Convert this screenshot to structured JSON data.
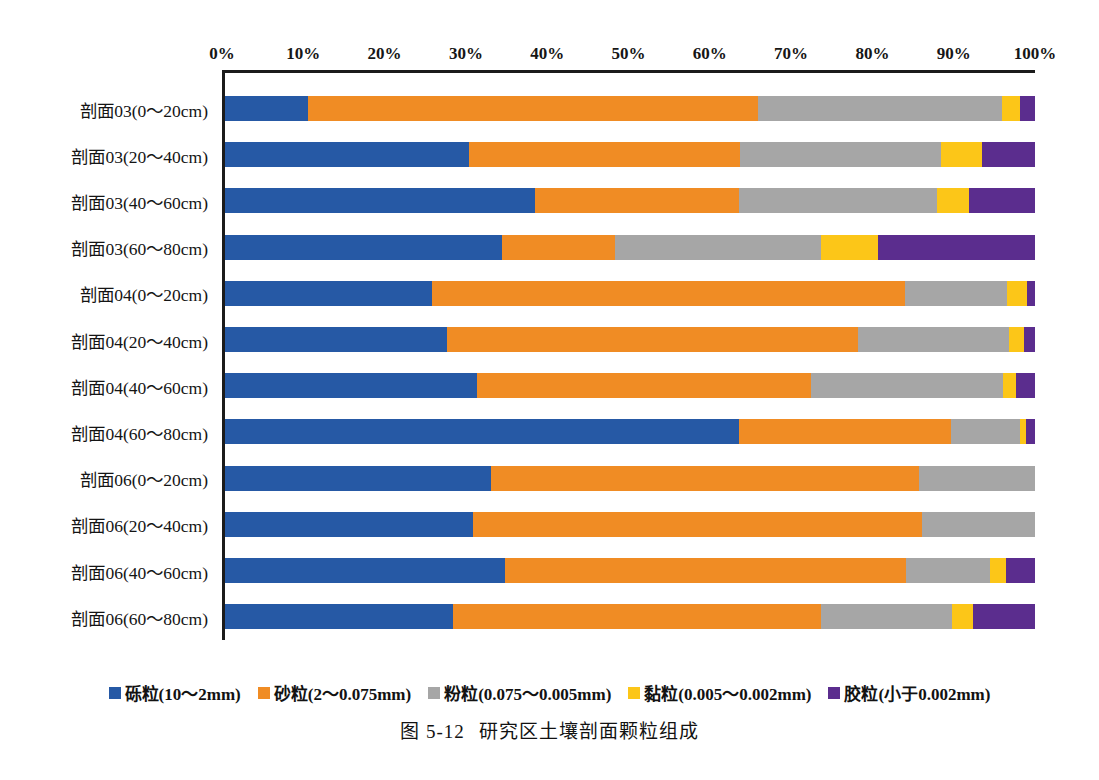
{
  "caption": {
    "number": "图 5-12",
    "title": "研究区土壤剖面颗粒组成"
  },
  "chart_data": {
    "type": "bar",
    "orientation": "horizontal",
    "stacked": true,
    "stack_normalized": true,
    "title": "研究区土壤剖面颗粒组成",
    "xlabel": "",
    "ylabel": "",
    "xlim": [
      0,
      100
    ],
    "grid": false,
    "legend_position": "bottom",
    "tick_labels": [
      "0%",
      "10%",
      "20%",
      "30%",
      "40%",
      "50%",
      "60%",
      "70%",
      "80%",
      "90%",
      "100%"
    ],
    "tick_values": [
      0,
      10,
      20,
      30,
      40,
      50,
      60,
      70,
      80,
      90,
      100
    ],
    "categories": [
      "剖面03(0～20cm)",
      "剖面03(20～40cm)",
      "剖面03(40～60cm)",
      "剖面03(60～80cm)",
      "剖面04(0～20cm)",
      "剖面04(20～40cm)",
      "剖面04(40～60cm)",
      "剖面04(60～80cm)",
      "剖面06(0～20cm)",
      "剖面06(20～40cm)",
      "剖面06(40～60cm)",
      "剖面06(60～80cm)"
    ],
    "series": [
      {
        "name": "砾粒(10～2mm)",
        "color": "#2659a5",
        "values": [
          10.2,
          30.1,
          38.3,
          34.2,
          25.6,
          27.4,
          31.1,
          63.4,
          32.8,
          30.6,
          34.6,
          28.1
        ]
      },
      {
        "name": "砂粒(2～0.075mm)",
        "color": "#f08c24",
        "values": [
          55.6,
          33.5,
          25.2,
          13.9,
          58.4,
          50.8,
          41.2,
          26.2,
          52.9,
          55.5,
          49.5,
          45.5
        ]
      },
      {
        "name": "粉粒(0.075～0.005mm)",
        "color": "#a6a6a6",
        "values": [
          30.1,
          24.8,
          24.4,
          25.5,
          12.6,
          18.6,
          23.7,
          8.5,
          14.3,
          13.9,
          10.3,
          16.2
        ]
      },
      {
        "name": "黏粒(0.005～0.002mm)",
        "color": "#fcc618",
        "values": [
          2.2,
          5.1,
          3.9,
          7.0,
          2.4,
          1.9,
          1.7,
          0.8,
          0.0,
          0.0,
          2.0,
          2.6
        ]
      },
      {
        "name": "胶粒(小于0.002mm)",
        "color": "#5b2d8e",
        "values": [
          1.9,
          6.5,
          8.2,
          19.4,
          1.0,
          1.3,
          2.3,
          1.1,
          0.0,
          0.0,
          3.6,
          7.6
        ]
      }
    ]
  },
  "legend": {
    "items": [
      {
        "label": "砾粒(10～2mm)",
        "color": "#2659a5"
      },
      {
        "label": "砂粒(2～0.075mm)",
        "color": "#f08c24"
      },
      {
        "label": "粉粒(0.075～0.005mm)",
        "color": "#a6a6a6"
      },
      {
        "label": "黏粒(0.005～0.002mm)",
        "color": "#fcc618"
      },
      {
        "label": "胶粒(小于0.002mm)",
        "color": "#5b2d8e"
      }
    ]
  }
}
